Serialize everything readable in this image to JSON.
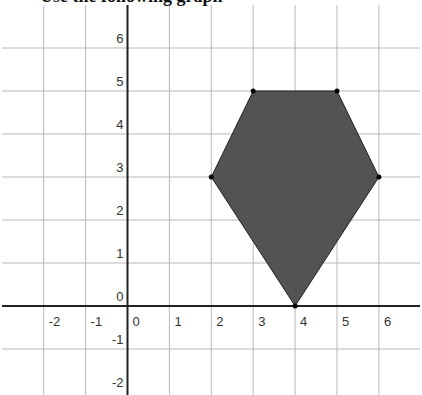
{
  "title_fragment": "Use the following graph",
  "chart_data": {
    "type": "scatter",
    "title": "",
    "xlabel": "",
    "ylabel": "",
    "xlim": [
      -3,
      6.9
    ],
    "ylim": [
      -2.2,
      7
    ],
    "grid": true,
    "x_ticks": [
      -2,
      -1,
      0,
      1,
      2,
      3,
      4,
      5,
      6
    ],
    "y_ticks": [
      -2,
      -1,
      0,
      1,
      2,
      3,
      4,
      5,
      6
    ],
    "shape": "hexagon",
    "fill": "#4a4a4a",
    "vertices": [
      {
        "x": 3,
        "y": 5
      },
      {
        "x": 5,
        "y": 5
      },
      {
        "x": 6,
        "y": 3
      },
      {
        "x": 4,
        "y": 0
      },
      {
        "x": 2,
        "y": 3
      }
    ]
  },
  "labels": {
    "x": [
      "-2",
      "-1",
      "0",
      "1",
      "2",
      "3",
      "4",
      "5",
      "6"
    ],
    "y": [
      "6",
      "5",
      "4",
      "3",
      "2",
      "1",
      "0",
      "-1",
      "-2"
    ]
  }
}
